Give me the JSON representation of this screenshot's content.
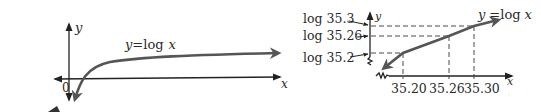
{
  "left_graph": {
    "y_axis_label": "y",
    "x_axis_label": "x",
    "origin_label": "0",
    "curve_label_lhs": "y",
    "curve_label_eq": "=log",
    "curve_label_var": "x"
  },
  "right_graph": {
    "y_axis_label": "y",
    "x_axis_label": "x",
    "curve_label_lhs": "y",
    "curve_label_eq": "=log",
    "curve_label_var": "x",
    "y_ticks": [
      "log 35.3",
      "log 35.26",
      "log 35.2"
    ],
    "x_ticks": [
      "35.20",
      "35.26",
      "35.30"
    ]
  },
  "colors": {
    "curve": "#555555",
    "axis": "#222222"
  }
}
